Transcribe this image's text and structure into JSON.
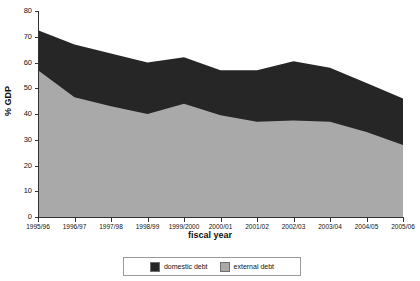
{
  "chart_data": {
    "type": "area",
    "stacked": true,
    "title": "",
    "subtitle": "",
    "xlabel": "fiscal year",
    "ylabel": "% GDP",
    "categories": [
      "1995/96",
      "1996/97",
      "1997/98",
      "1998/99",
      "1999/2000",
      "2000/01",
      "2001/02",
      "2002/03",
      "2003/04",
      "2004/05",
      "2005/06"
    ],
    "series": [
      {
        "name": "external debt",
        "color": "#a9a9a9",
        "values": [
          57,
          46.5,
          43,
          40,
          44,
          39.5,
          37,
          37.5,
          37,
          33,
          28
        ]
      },
      {
        "name": "domestic debt",
        "color": "#262626",
        "values": [
          15.5,
          20.5,
          20.5,
          20,
          18,
          17.5,
          20,
          23,
          21,
          19,
          18
        ]
      }
    ],
    "totals": [
      72.5,
      67,
      63.5,
      60,
      62,
      57,
      57,
      60.5,
      58,
      52,
      46
    ],
    "ylim": [
      0,
      80
    ],
    "yticks": [
      0,
      10,
      20,
      30,
      40,
      50,
      60,
      70,
      80
    ],
    "grid": false,
    "legend_position": "bottom",
    "legend_order": [
      "domestic debt",
      "external debt"
    ]
  },
  "legend": {
    "items": [
      {
        "label": "domestic debt",
        "color": "#262626"
      },
      {
        "label": "external debt",
        "color": "#a9a9a9"
      }
    ]
  }
}
